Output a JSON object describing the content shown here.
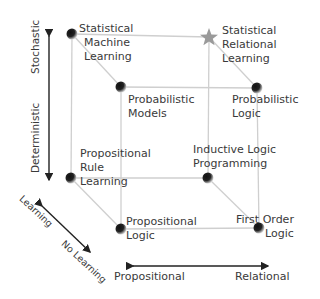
{
  "axes": {
    "vertical": {
      "top": "Stochastic",
      "bottom": "Deterministic"
    },
    "horizontal": {
      "left": "Propositional",
      "right": "Relational"
    },
    "depth": {
      "back": "Learning",
      "front": "No Learning"
    }
  },
  "nodes": {
    "statistical_machine_learning": {
      "line1": "Statistical",
      "line2": "Machine",
      "line3": "Learning",
      "marker": "sphere"
    },
    "statistical_relational_learning": {
      "line1": "Statistical",
      "line2": "Relational",
      "line3": "Learning",
      "marker": "star"
    },
    "probabilistic_models": {
      "line1": "Probabilistic",
      "line2": "Models",
      "marker": "sphere"
    },
    "probabilistic_logic": {
      "line1": "Probabilistic",
      "line2": "Logic",
      "marker": "sphere"
    },
    "propositional_rule_learning": {
      "line1": "Propositional",
      "line2": "Rule",
      "line3": "Learning",
      "marker": "sphere"
    },
    "inductive_logic_programming": {
      "line1": "Inductive Logic",
      "line2": "Programming",
      "marker": "sphere"
    },
    "propositional_logic": {
      "line1": "Propositional",
      "line2": "Logic",
      "marker": "sphere"
    },
    "first_order_logic": {
      "line1": "First Order",
      "line2": "Logic",
      "marker": "sphere"
    }
  },
  "colors": {
    "edge": "#cfcfcf",
    "arrow": "#222222",
    "star": "#9a9a9a",
    "text": "#3a3a3a"
  }
}
